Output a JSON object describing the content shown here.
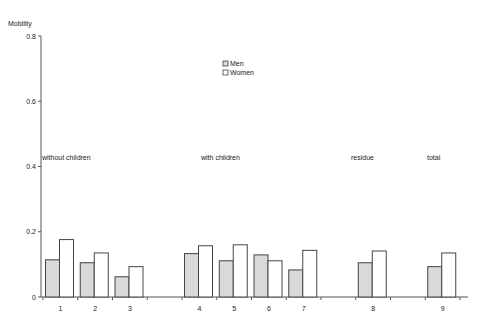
{
  "chart_data": {
    "type": "bar",
    "title": "",
    "ylabel": "Mobility",
    "xlabel": "",
    "ylim": [
      0,
      0.8
    ],
    "yticks": [
      "0",
      "0.2",
      "0.4",
      "0.6",
      "0.8"
    ],
    "grid": false,
    "legend_position": "top-center",
    "categories": [
      "1",
      "2",
      "3",
      "",
      "4",
      "5",
      "6",
      "7",
      "",
      "8",
      "",
      "9"
    ],
    "series": [
      {
        "name": "Men",
        "color": "#d9d9d9",
        "values": [
          0.114,
          0.105,
          0.062,
          null,
          0.133,
          0.111,
          0.129,
          0.083,
          null,
          0.105,
          null,
          0.093
        ]
      },
      {
        "name": "Women",
        "color": "#ffffff",
        "values": [
          0.176,
          0.135,
          0.093,
          null,
          0.157,
          0.16,
          0.111,
          0.143,
          null,
          0.141,
          null,
          0.135
        ]
      }
    ],
    "group_labels": [
      {
        "text": "without children",
        "x": 42
      },
      {
        "text": "with children",
        "x": 201
      },
      {
        "text": "residue",
        "x": 351
      },
      {
        "text": "total",
        "x": 427
      }
    ]
  }
}
